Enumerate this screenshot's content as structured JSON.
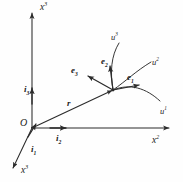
{
  "figure": {
    "kind": "diagram",
    "stroke_color": "#2b2b2b",
    "text_color": "#1a1a1a",
    "background": "#ffffff"
  },
  "axes": [
    {
      "id": "x3",
      "label_base": "x",
      "label_sup": "3",
      "direction": "up",
      "x": 40,
      "y": 3
    },
    {
      "id": "x2",
      "label_base": "x",
      "label_sup": "2",
      "direction": "right",
      "x": 152,
      "y": 136
    },
    {
      "id": "x1",
      "label_base": "x",
      "label_sup": "3",
      "direction": "down-left",
      "x": 21,
      "y": 166
    }
  ],
  "origin": {
    "label": "O",
    "x": 20,
    "y": 118
  },
  "cartesian_basis": [
    {
      "id": "i3",
      "label_base": "i",
      "label_sub": "3",
      "x": 24,
      "y": 85
    },
    {
      "id": "i2",
      "label_base": "i",
      "label_sub": "2",
      "x": 56,
      "y": 134
    },
    {
      "id": "i1",
      "label_base": "i",
      "label_sub": "1",
      "x": 31,
      "y": 145
    }
  ],
  "position_vector": {
    "id": "r",
    "label_base": "r",
    "x": 67,
    "y": 99
  },
  "curvilinear_basis": [
    {
      "id": "e3",
      "label_base": "e",
      "label_sub": "3",
      "x": 71,
      "y": 66
    },
    {
      "id": "e2",
      "label_base": "e",
      "label_sub": "2",
      "x": 101,
      "y": 57
    },
    {
      "id": "e1",
      "label_base": "e",
      "label_sub": "1",
      "x": 127,
      "y": 73
    }
  ],
  "coordinate_curves": [
    {
      "id": "u3",
      "label_base": "u",
      "label_sup": "3",
      "x": 111,
      "y": 33
    },
    {
      "id": "u2",
      "label_base": "u",
      "label_sup": "2",
      "x": 152,
      "y": 58
    },
    {
      "id": "u1",
      "label_base": "u",
      "label_sup": "1",
      "x": 160,
      "y": 107
    }
  ],
  "geometry": {
    "origin_point": {
      "x": 32,
      "y": 128
    },
    "point_p": {
      "x": 113,
      "y": 90
    }
  }
}
